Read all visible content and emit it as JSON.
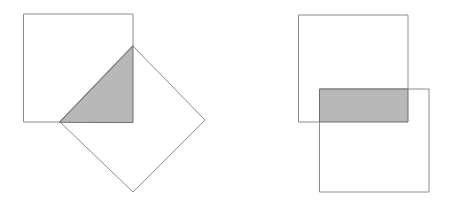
{
  "figure": {
    "canvas": {
      "width": 450,
      "height": 206,
      "background": "#ffffff"
    },
    "style": {
      "outline_color": "#8c8c8c",
      "outline_width": 1,
      "square_fill": "#ffffff",
      "intersection_fill": "#b8b8b8",
      "intersection_outline": "#6e6e6e"
    },
    "panels": [
      {
        "name": "left-panel",
        "label": "Rotated square overlapping an upright square",
        "shapes": [
          {
            "name": "upright-square",
            "type": "square",
            "points": "24,14 133,14 133,122 24,122",
            "x": 24,
            "y": 14,
            "width": 109,
            "height": 108,
            "rotation_deg": 0,
            "fill": "#ffffff"
          },
          {
            "name": "rotated-square-diamond",
            "type": "square",
            "points": "133,46 205,120 133,192 60,122",
            "rotation_deg": 45,
            "vertices": {
              "top": [
                133,
                46
              ],
              "right": [
                205,
                120
              ],
              "bottom": [
                133,
                192
              ],
              "left": [
                60,
                122
              ]
            },
            "fill": "#ffffff"
          }
        ],
        "intersection": {
          "name": "triangle-intersection",
          "type": "triangle",
          "points": "60,122 133,46 133,122",
          "vertices": [
            [
              60,
              122
            ],
            [
              133,
              46
            ],
            [
              133,
              122
            ]
          ],
          "fill": "#b8b8b8"
        }
      },
      {
        "name": "right-panel",
        "label": "Two upright squares overlapping in a horizontal band",
        "shapes": [
          {
            "name": "upper-square",
            "type": "square",
            "points": "299,15 408,15 408,122 299,122",
            "x": 299,
            "y": 15,
            "width": 109,
            "height": 107,
            "rotation_deg": 0,
            "fill": "#ffffff"
          },
          {
            "name": "lower-square",
            "type": "square",
            "points": "320,89 429,89 429,192 320,192",
            "x": 320,
            "y": 89,
            "width": 109,
            "height": 103,
            "rotation_deg": 0,
            "fill": "#ffffff"
          }
        ],
        "intersection": {
          "name": "band-intersection",
          "type": "rectangle",
          "points": "320,89 408,89 408,122 320,122",
          "x": 320,
          "y": 89,
          "width": 88,
          "height": 33,
          "fill": "#b8b8b8"
        }
      }
    ]
  }
}
